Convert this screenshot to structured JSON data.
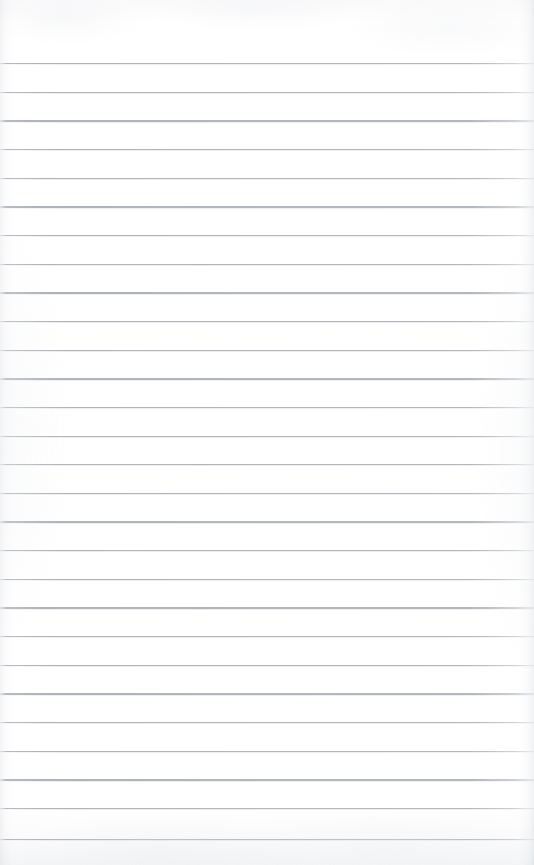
{
  "document": {
    "kind": "lined-paper-scan",
    "title": "Blank Lined Notepad Page",
    "orientation": "portrait",
    "width_px": 534,
    "height_px": 865,
    "content_text": "",
    "is_blank": true
  },
  "paper": {
    "background_color": "#fdfdfd",
    "edge_shadow_color": "#eef0f2",
    "grain_color": "#e9ebef"
  },
  "ruling": {
    "line_color": "#b2b7be",
    "line_shadow_color": "#cdd1d7",
    "line_thickness_px": 1.4,
    "line_spacing_px": 28.65,
    "first_line_y_px": 63,
    "line_count": 28,
    "line_left_x_px": 0,
    "line_right_x_px": 534,
    "margin_rule": "none",
    "top_margin_px": 63,
    "bottom_margin_px": 24,
    "line_y_positions": [
      63,
      91.7,
      120.3,
      149,
      177.6,
      206.3,
      234.9,
      263.6,
      292.2,
      320.9,
      349.5,
      378.2,
      406.8,
      435.5,
      464.1,
      492.8,
      521.4,
      550.1,
      578.7,
      607.4,
      636,
      664.7,
      693.3,
      722,
      750.6,
      779.3,
      807.9,
      838.5
    ]
  },
  "regions": {
    "top_margin_label": "top-margin",
    "bottom_margin_label": "bottom-margin",
    "left_edge_label": "left-edge",
    "writing_area_label": "writing-area"
  }
}
